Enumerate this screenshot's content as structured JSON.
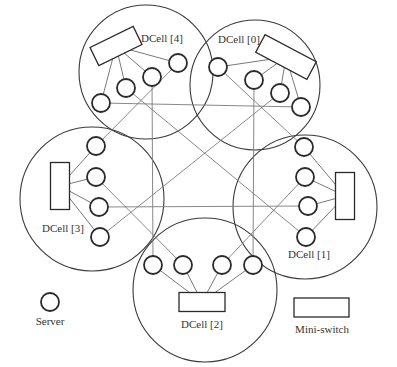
{
  "diagram": {
    "type": "DCell network topology",
    "cells": [
      {
        "id": "dcell0",
        "label": "DCell [0]",
        "center": [
          255,
          85
        ],
        "r": 65,
        "switch": {
          "cx": 286,
          "cy": 57,
          "w": 58,
          "h": 20,
          "rot": 28
        },
        "servers": [
          [
            218,
            67
          ],
          [
            254,
            80
          ],
          [
            280,
            93
          ],
          [
            301,
            107
          ]
        ],
        "label_pos": [
          218,
          43
        ]
      },
      {
        "id": "dcell1",
        "label": "DCell [1]",
        "center": [
          305,
          207
        ],
        "r": 72,
        "switch": {
          "cx": 345,
          "cy": 196,
          "w": 19,
          "h": 47,
          "rot": 0
        },
        "servers": [
          [
            304,
            147
          ],
          [
            305,
            177
          ],
          [
            308,
            206
          ],
          [
            306,
            237
          ]
        ],
        "label_pos": [
          288,
          258
        ]
      },
      {
        "id": "dcell2",
        "label": "DCell [2]",
        "center": [
          205,
          290
        ],
        "r": 72,
        "switch": {
          "cx": 202,
          "cy": 302,
          "w": 46,
          "h": 19,
          "rot": 0
        },
        "servers": [
          [
            153,
            265
          ],
          [
            183,
            265
          ],
          [
            222,
            265
          ],
          [
            253,
            265
          ]
        ],
        "label_pos": [
          181,
          328
        ]
      },
      {
        "id": "dcell3",
        "label": "DCell [3]",
        "center": [
          92,
          199
        ],
        "r": 72,
        "switch": {
          "cx": 60,
          "cy": 186,
          "w": 19,
          "h": 47,
          "rot": 0
        },
        "servers": [
          [
            96,
            146
          ],
          [
            96,
            177
          ],
          [
            99,
            207
          ],
          [
            100,
            237
          ]
        ],
        "label_pos": [
          42,
          232
        ]
      },
      {
        "id": "dcell4",
        "label": "DCell [4]",
        "center": [
          146,
          72
        ],
        "r": 67,
        "switch": {
          "cx": 116,
          "cy": 46,
          "w": 48,
          "h": 20,
          "rot": -26
        },
        "servers": [
          [
            101,
            103
          ],
          [
            126,
            88
          ],
          [
            152,
            77
          ],
          [
            178,
            63
          ]
        ],
        "label_pos": [
          141,
          42
        ]
      }
    ],
    "inter_links": [
      [
        [
          101,
          103
        ],
        [
          301,
          107
        ]
      ],
      [
        [
          152,
          77
        ],
        [
          153,
          265
        ]
      ],
      [
        [
          254,
          80
        ],
        [
          253,
          265
        ]
      ],
      [
        [
          99,
          207
        ],
        [
          308,
          206
        ]
      ],
      [
        [
          178,
          63
        ],
        [
          96,
          146
        ]
      ],
      [
        [
          218,
          67
        ],
        [
          304,
          147
        ]
      ],
      [
        [
          126,
          88
        ],
        [
          306,
          237
        ]
      ],
      [
        [
          280,
          93
        ],
        [
          100,
          237
        ]
      ],
      [
        [
          96,
          177
        ],
        [
          183,
          265
        ]
      ],
      [
        [
          305,
          177
        ],
        [
          222,
          265
        ]
      ]
    ]
  },
  "legend": {
    "server": {
      "label": "Server",
      "icon": "circle",
      "pos": [
        50,
        300
      ]
    },
    "switch": {
      "label": "Mini-switch",
      "icon": "rectangle",
      "pos": [
        322,
        306
      ]
    }
  },
  "colors": {
    "stroke_dark": "#2a2a2a",
    "stroke_link": "#7a7a7a",
    "background": "#ffffff"
  }
}
